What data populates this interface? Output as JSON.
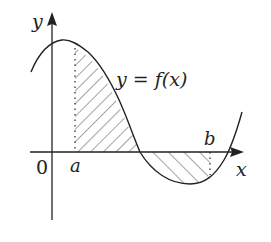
{
  "diagram": {
    "type": "function-area-plot",
    "labels": {
      "y_axis": "y",
      "x_axis": "x",
      "origin": "0",
      "a": "a",
      "b": "b",
      "function": "y = f(x)"
    },
    "colors": {
      "stroke": "#222222",
      "background": "#ffffff"
    }
  }
}
